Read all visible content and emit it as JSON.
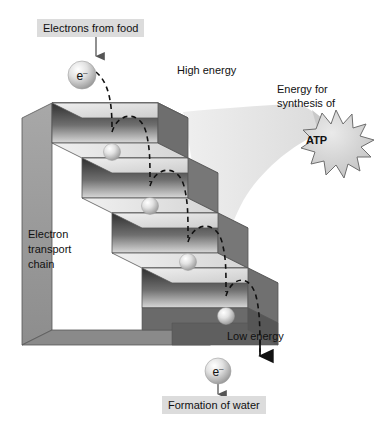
{
  "diagram": {
    "labels": {
      "electrons_from_food": "Electrons from food",
      "high_energy": "High energy",
      "low_energy": "Low energy",
      "electron_transport_chain_line1": "Electron",
      "electron_transport_chain_line2": "transport",
      "electron_transport_chain_line3": "chain",
      "energy_for_line1": "Energy for",
      "energy_for_line2": "synthesis of",
      "atp": "ATP",
      "formation_of_water": "Formation of water",
      "electron_symbol": "e",
      "electron_charge": "–"
    },
    "colors": {
      "label_box_bg": "#dcdcdc",
      "text": "#111111",
      "step_tread": "#e8e8e8",
      "step_riser_dark": "#3a3a3a",
      "step_riser_light": "#d8d8d8",
      "side_panel": "#9a9a9a",
      "funnel": "#e3e3e3",
      "starburst_fill": "#d4d4d4",
      "starburst_stroke": "#6e6e6e",
      "sphere_light": "#f2f2f2",
      "sphere_dark": "#9d9d9d",
      "arrow": "#1a1a1a",
      "dashed_path": "#1a1a1a"
    },
    "steps": {
      "count": 4,
      "direction": "descending left-to-right"
    },
    "electrons": {
      "count_on_steps": 4,
      "count_top": 1,
      "count_bottom": 1
    }
  }
}
